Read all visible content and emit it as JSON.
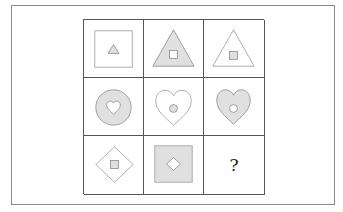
{
  "puzzle": {
    "rows": 3,
    "cols": 3,
    "fill_color": "#e0e0e0",
    "stroke_color": "#888888",
    "cells": [
      {
        "row": 1,
        "col": 1,
        "outer": "square",
        "outer_fill": "white",
        "inner": "triangle",
        "inner_fill": "gray"
      },
      {
        "row": 1,
        "col": 2,
        "outer": "triangle",
        "outer_fill": "gray",
        "inner": "square",
        "inner_fill": "white"
      },
      {
        "row": 1,
        "col": 3,
        "outer": "triangle",
        "outer_fill": "white",
        "inner": "square",
        "inner_fill": "gray"
      },
      {
        "row": 2,
        "col": 1,
        "outer": "circle",
        "outer_fill": "gray",
        "inner": "heart",
        "inner_fill": "white"
      },
      {
        "row": 2,
        "col": 2,
        "outer": "heart",
        "outer_fill": "white",
        "inner": "circle",
        "inner_fill": "gray"
      },
      {
        "row": 2,
        "col": 3,
        "outer": "heart",
        "outer_fill": "gray",
        "inner": "circle",
        "inner_fill": "white"
      },
      {
        "row": 3,
        "col": 1,
        "outer": "diamond",
        "outer_fill": "white",
        "inner": "square",
        "inner_fill": "gray"
      },
      {
        "row": 3,
        "col": 2,
        "outer": "square",
        "outer_fill": "gray",
        "inner": "diamond",
        "inner_fill": "white"
      },
      {
        "row": 3,
        "col": 3,
        "outer": "unknown",
        "label": "?"
      }
    ],
    "question_mark": "?"
  }
}
